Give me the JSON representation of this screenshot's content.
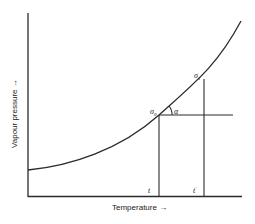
{
  "diagram": {
    "type": "vapour-pressure-temperature-curve",
    "x_axis": {
      "label": "Temperature →"
    },
    "y_axis": {
      "label": "Vapour pressure →"
    },
    "points": [
      {
        "id": "p0",
        "symbol": "σ",
        "subscript": "0",
        "x": 159,
        "y": 115
      },
      {
        "id": "p1",
        "symbol": "σ",
        "subscript": "1",
        "x": 204,
        "y": 79
      }
    ],
    "angle_label": "α",
    "x_ticks": [
      {
        "id": "t",
        "label": "t",
        "x": 159
      },
      {
        "id": "t1",
        "label": "t",
        "prime": "′",
        "x": 204
      }
    ],
    "colors": {
      "line": "#2a2a2a",
      "background": "#ffffff"
    }
  }
}
